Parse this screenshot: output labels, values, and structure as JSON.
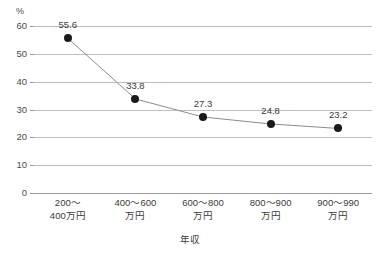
{
  "chart_data": {
    "type": "line",
    "title": "",
    "xlabel": "年収",
    "ylabel": "",
    "yunit": "%",
    "ylim": [
      0,
      60
    ],
    "yticks": [
      0,
      10,
      20,
      30,
      40,
      50,
      60
    ],
    "ytick_labels": [
      "0",
      "10",
      "20",
      "30",
      "40",
      "50",
      "60"
    ],
    "grid": true,
    "legend": "none",
    "categories": [
      {
        "line1": "200〜",
        "line2": "400万円"
      },
      {
        "line1": "400〜600",
        "line2": "万円"
      },
      {
        "line1": "600〜800",
        "line2": "万円"
      },
      {
        "line1": "800〜900",
        "line2": "万円"
      },
      {
        "line1": "900〜990",
        "line2": "万円"
      }
    ],
    "category_labels": [
      "200〜400万円",
      "400〜600万円",
      "600〜800万円",
      "800〜900万円",
      "900〜990万円"
    ],
    "values": [
      55.6,
      33.8,
      27.3,
      24.8,
      23.2
    ],
    "data_labels": [
      "55.6",
      "33.8",
      "27.3",
      "24.8",
      "23.2"
    ],
    "marker": "filled-circle",
    "marker_color": "#1a1a1a",
    "line_color": "#8c8c8c",
    "grid_color": "#bfbfbf",
    "axis_color": "#9a9a9a",
    "background_color": "#ffffff"
  }
}
